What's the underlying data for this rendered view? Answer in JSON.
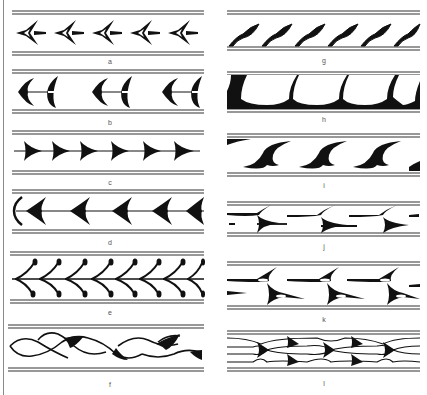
{
  "figure": {
    "colors": {
      "ink": "#111111",
      "rule": "#333333",
      "label": "#555555",
      "background": "#ffffff"
    },
    "panels": [
      {
        "id": "a",
        "label": "a",
        "motif": "arrowhead-outlined",
        "column": "left"
      },
      {
        "id": "b",
        "label": "b",
        "motif": "crescent-arrow",
        "column": "left"
      },
      {
        "id": "c",
        "label": "c",
        "motif": "triangle-chain",
        "column": "left"
      },
      {
        "id": "d",
        "label": "d",
        "motif": "barbed-arrow-chain",
        "column": "left"
      },
      {
        "id": "e",
        "label": "e",
        "motif": "leaf-scroll",
        "column": "left"
      },
      {
        "id": "f",
        "label": "f",
        "motif": "interlaced-wave",
        "column": "left"
      },
      {
        "id": "g",
        "label": "g",
        "motif": "slanted-flag",
        "column": "right"
      },
      {
        "id": "h",
        "label": "h",
        "motif": "scalloped-arch",
        "column": "right"
      },
      {
        "id": "i",
        "label": "i",
        "motif": "hook-scroll",
        "column": "right"
      },
      {
        "id": "j",
        "label": "j",
        "motif": "split-wedge",
        "column": "right"
      },
      {
        "id": "k",
        "label": "k",
        "motif": "double-split-wedge",
        "column": "right"
      },
      {
        "id": "l",
        "label": "l",
        "motif": "braided-wedge",
        "column": "right"
      }
    ]
  }
}
